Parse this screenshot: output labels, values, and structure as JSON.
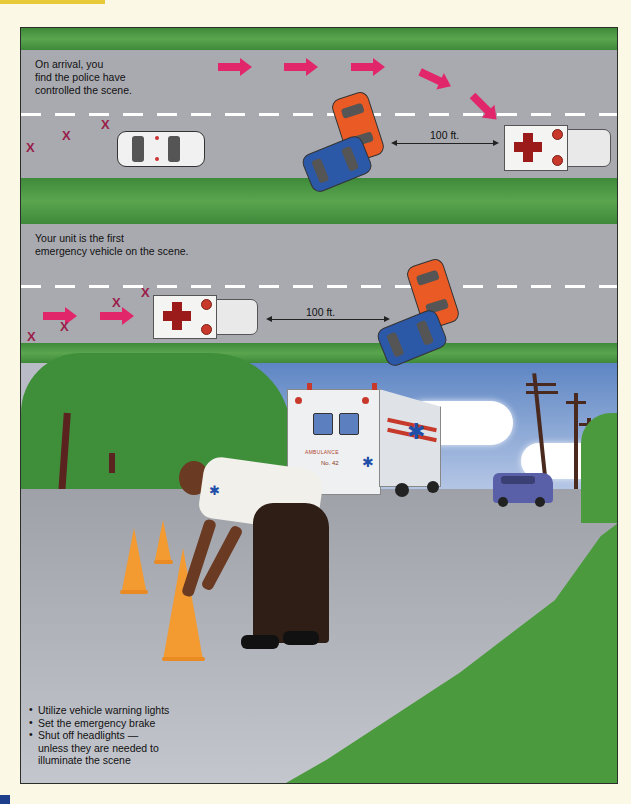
{
  "panel_1": {
    "caption_lines": [
      "On arrival, you",
      "find the police have",
      "controlled the scene."
    ],
    "distance_label": "100 ft.",
    "police_car_text": "POLICE",
    "hazard_mark": "X",
    "hazard_count": 4,
    "arrow_count": 5
  },
  "panel_2": {
    "caption_lines": [
      "Your unit is the first",
      "emergency vehicle on the scene."
    ],
    "distance_label": "100 ft.",
    "hazard_mark": "X",
    "hazard_count": 4,
    "arrow_count": 2
  },
  "scene": {
    "ambulance_text": "AMBULANCE",
    "ambulance_number": "No. 42",
    "bullets": [
      "Utilize vehicle warning lights",
      "Set the emergency brake",
      "Shut off headlights — unless they are needed to illuminate the scene"
    ]
  },
  "colors": {
    "arrow": "#e2266a",
    "hazard_x": "#9a1e4a",
    "cross": "#9b1b1b",
    "grass": "#4c9a3e",
    "road": "#a9aab0",
    "page_bg": "#fbf8e6",
    "accent_tab": "#e7c93a"
  }
}
